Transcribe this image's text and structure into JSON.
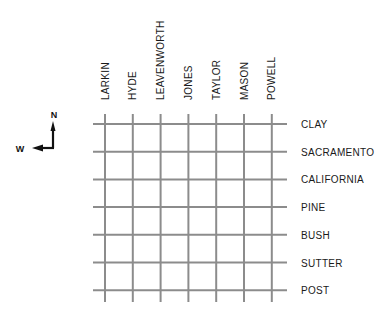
{
  "map": {
    "type": "street-grid",
    "colors": {
      "grid": "#8c8c8c",
      "text": "#1a1a1a",
      "compass": "#111111",
      "background": "#ffffff"
    },
    "compass": {
      "north_label": "N",
      "west_label": "W",
      "icon": "compass-north-west-arrow-icon"
    },
    "north_south_streets": [
      {
        "name": "LARKIN"
      },
      {
        "name": "HYDE"
      },
      {
        "name": "LEAVENWORTH"
      },
      {
        "name": "JONES"
      },
      {
        "name": "TAYLOR"
      },
      {
        "name": "MASON"
      },
      {
        "name": "POWELL"
      }
    ],
    "east_west_streets": [
      {
        "name": "CLAY"
      },
      {
        "name": "SACRAMENTO"
      },
      {
        "name": "CALIFORNIA"
      },
      {
        "name": "PINE"
      },
      {
        "name": "BUSH"
      },
      {
        "name": "SUTTER"
      },
      {
        "name": "POST"
      }
    ]
  }
}
